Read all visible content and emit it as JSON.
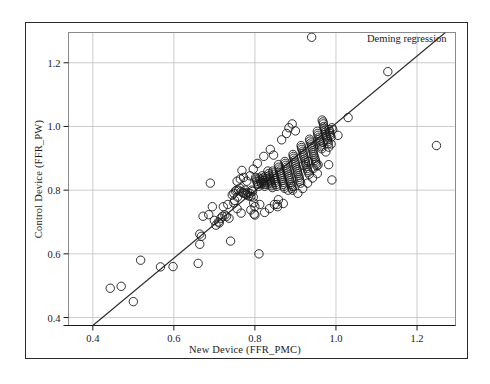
{
  "chart_data": {
    "type": "scatter",
    "title": "",
    "xlabel": "New Device  (FFR_PMC)",
    "ylabel": "Control Device  (FFR_PW)",
    "xlim": [
      0.34,
      1.295
    ],
    "ylim": [
      0.375,
      1.295
    ],
    "xticks": [
      0.4,
      0.6,
      0.8,
      1.0,
      1.2
    ],
    "xticklabels": [
      "0.4",
      "0.6",
      "0.8",
      "1.0",
      "1.2"
    ],
    "yticks": [
      0.4,
      0.6,
      0.8,
      1.0,
      1.2
    ],
    "yticklabels": [
      "0.4",
      "0.6",
      "0.8",
      "1.0",
      "1.2"
    ],
    "grid": true,
    "grid_color": "#bfbfbf",
    "marker": "open-circle",
    "marker_color": "#1a1a1a",
    "marker_size": 4.2,
    "annotations": [
      {
        "text": "Deming regression",
        "x": 1.06,
        "y": 1.265
      }
    ],
    "fit_line": {
      "name": "Deming regression",
      "color": "#2b2b2b",
      "x_start": 0.4,
      "y_start": 0.375,
      "x_end": 1.27,
      "y_end": 1.295
    },
    "series": [
      {
        "name": "FFR measurements",
        "points": [
          [
            0.443,
            0.492
          ],
          [
            0.47,
            0.498
          ],
          [
            0.5,
            0.45
          ],
          [
            0.518,
            0.58
          ],
          [
            0.567,
            0.559
          ],
          [
            0.598,
            0.56
          ],
          [
            0.66,
            0.57
          ],
          [
            0.664,
            0.662
          ],
          [
            0.668,
            0.655
          ],
          [
            0.664,
            0.63
          ],
          [
            0.69,
            0.822
          ],
          [
            0.672,
            0.718
          ],
          [
            0.686,
            0.723
          ],
          [
            0.695,
            0.748
          ],
          [
            0.7,
            0.705
          ],
          [
            0.704,
            0.69
          ],
          [
            0.71,
            0.7
          ],
          [
            0.712,
            0.697
          ],
          [
            0.716,
            0.712
          ],
          [
            0.72,
            0.718
          ],
          [
            0.722,
            0.748
          ],
          [
            0.726,
            0.722
          ],
          [
            0.73,
            0.718
          ],
          [
            0.733,
            0.755
          ],
          [
            0.736,
            0.712
          ],
          [
            0.74,
            0.64
          ],
          [
            0.744,
            0.785
          ],
          [
            0.748,
            0.79
          ],
          [
            0.75,
            0.768
          ],
          [
            0.752,
            0.797
          ],
          [
            0.755,
            0.8
          ],
          [
            0.757,
            0.778
          ],
          [
            0.76,
            0.8
          ],
          [
            0.763,
            0.806
          ],
          [
            0.766,
            0.795
          ],
          [
            0.768,
            0.862
          ],
          [
            0.77,
            0.792
          ],
          [
            0.773,
            0.79
          ],
          [
            0.776,
            0.8
          ],
          [
            0.778,
            0.788
          ],
          [
            0.78,
            0.785
          ],
          [
            0.782,
            0.793
          ],
          [
            0.785,
            0.782
          ],
          [
            0.788,
            0.79
          ],
          [
            0.79,
            0.78
          ],
          [
            0.792,
            0.8
          ],
          [
            0.794,
            0.796
          ],
          [
            0.796,
            0.778
          ],
          [
            0.797,
            0.76
          ],
          [
            0.798,
            0.725
          ],
          [
            0.8,
            0.722
          ],
          [
            0.802,
            0.84
          ],
          [
            0.803,
            0.835
          ],
          [
            0.805,
            0.828
          ],
          [
            0.806,
            0.822
          ],
          [
            0.808,
            0.818
          ],
          [
            0.809,
            0.812
          ],
          [
            0.81,
            0.6
          ],
          [
            0.811,
            0.838
          ],
          [
            0.813,
            0.832
          ],
          [
            0.815,
            0.826
          ],
          [
            0.816,
            0.82
          ],
          [
            0.818,
            0.845
          ],
          [
            0.819,
            0.838
          ],
          [
            0.82,
            0.83
          ],
          [
            0.821,
            0.824
          ],
          [
            0.823,
            0.818
          ],
          [
            0.824,
            0.812
          ],
          [
            0.826,
            0.843
          ],
          [
            0.827,
            0.836
          ],
          [
            0.828,
            0.83
          ],
          [
            0.83,
            0.824
          ],
          [
            0.831,
            0.818
          ],
          [
            0.832,
            0.86
          ],
          [
            0.834,
            0.852
          ],
          [
            0.835,
            0.845
          ],
          [
            0.836,
            0.838
          ],
          [
            0.838,
            0.832
          ],
          [
            0.839,
            0.826
          ],
          [
            0.84,
            0.82
          ],
          [
            0.841,
            0.814
          ],
          [
            0.843,
            0.808
          ],
          [
            0.844,
            0.86
          ],
          [
            0.845,
            0.854
          ],
          [
            0.846,
            0.848
          ],
          [
            0.848,
            0.842
          ],
          [
            0.849,
            0.836
          ],
          [
            0.85,
            0.83
          ],
          [
            0.851,
            0.824
          ],
          [
            0.853,
            0.818
          ],
          [
            0.854,
            0.812
          ],
          [
            0.855,
            0.755
          ],
          [
            0.856,
            0.748
          ],
          [
            0.858,
            0.88
          ],
          [
            0.859,
            0.872
          ],
          [
            0.86,
            0.866
          ],
          [
            0.861,
            0.86
          ],
          [
            0.863,
            0.854
          ],
          [
            0.864,
            0.848
          ],
          [
            0.865,
            0.842
          ],
          [
            0.866,
            0.836
          ],
          [
            0.868,
            0.83
          ],
          [
            0.869,
            0.824
          ],
          [
            0.87,
            0.818
          ],
          [
            0.871,
            0.812
          ],
          [
            0.873,
            0.806
          ],
          [
            0.874,
            0.89
          ],
          [
            0.875,
            0.884
          ],
          [
            0.876,
            0.878
          ],
          [
            0.878,
            0.872
          ],
          [
            0.879,
            0.866
          ],
          [
            0.88,
            0.86
          ],
          [
            0.881,
            0.854
          ],
          [
            0.883,
            0.848
          ],
          [
            0.884,
            0.842
          ],
          [
            0.885,
            0.836
          ],
          [
            0.886,
            0.83
          ],
          [
            0.888,
            0.824
          ],
          [
            0.889,
            0.818
          ],
          [
            0.89,
            0.812
          ],
          [
            0.891,
            0.806
          ],
          [
            0.893,
            0.8
          ],
          [
            0.894,
            0.912
          ],
          [
            0.895,
            0.906
          ],
          [
            0.896,
            0.9
          ],
          [
            0.898,
            0.894
          ],
          [
            0.899,
            0.888
          ],
          [
            0.9,
            0.882
          ],
          [
            0.901,
            0.876
          ],
          [
            0.903,
            0.87
          ],
          [
            0.904,
            0.864
          ],
          [
            0.905,
            0.858
          ],
          [
            0.906,
            0.852
          ],
          [
            0.908,
            0.846
          ],
          [
            0.909,
            0.84
          ],
          [
            0.91,
            0.834
          ],
          [
            0.911,
            0.828
          ],
          [
            0.913,
            0.822
          ],
          [
            0.914,
            0.94
          ],
          [
            0.915,
            0.934
          ],
          [
            0.916,
            0.928
          ],
          [
            0.918,
            0.922
          ],
          [
            0.919,
            0.916
          ],
          [
            0.92,
            0.91
          ],
          [
            0.921,
            0.904
          ],
          [
            0.923,
            0.898
          ],
          [
            0.924,
            0.892
          ],
          [
            0.925,
            0.886
          ],
          [
            0.926,
            0.88
          ],
          [
            0.928,
            0.874
          ],
          [
            0.929,
            0.868
          ],
          [
            0.93,
            0.862
          ],
          [
            0.932,
            0.856
          ],
          [
            0.934,
            0.85
          ],
          [
            0.935,
            0.96
          ],
          [
            0.936,
            0.954
          ],
          [
            0.938,
            0.948
          ],
          [
            0.939,
            0.942
          ],
          [
            0.94,
            0.936
          ],
          [
            0.941,
            0.93
          ],
          [
            0.943,
            0.924
          ],
          [
            0.944,
            0.918
          ],
          [
            0.945,
            0.912
          ],
          [
            0.946,
            0.906
          ],
          [
            0.948,
            0.9
          ],
          [
            0.949,
            0.894
          ],
          [
            0.95,
            0.888
          ],
          [
            0.951,
            0.882
          ],
          [
            0.953,
            0.876
          ],
          [
            0.954,
            0.985
          ],
          [
            0.955,
            0.978
          ],
          [
            0.956,
            0.972
          ],
          [
            0.958,
            0.966
          ],
          [
            0.959,
            0.96
          ],
          [
            0.96,
            0.954
          ],
          [
            0.961,
            0.948
          ],
          [
            0.963,
            0.942
          ],
          [
            0.964,
            0.936
          ],
          [
            0.965,
            0.93
          ],
          [
            0.966,
            1.02
          ],
          [
            0.968,
            1.014
          ],
          [
            0.969,
            1.008
          ],
          [
            0.97,
            1.0
          ],
          [
            0.971,
            0.994
          ],
          [
            0.973,
            0.988
          ],
          [
            0.974,
            0.982
          ],
          [
            0.975,
            0.976
          ],
          [
            0.976,
            0.97
          ],
          [
            0.978,
            0.964
          ],
          [
            0.979,
            0.958
          ],
          [
            0.98,
            0.952
          ],
          [
            0.981,
            0.946
          ],
          [
            0.983,
            0.99
          ],
          [
            0.984,
            0.984
          ],
          [
            0.985,
            0.978
          ],
          [
            0.986,
            0.972
          ],
          [
            0.988,
            0.966
          ],
          [
            0.99,
            0.996
          ],
          [
            0.992,
            0.99
          ],
          [
            0.866,
            0.958
          ],
          [
            0.878,
            0.978
          ],
          [
            0.884,
            0.996
          ],
          [
            0.892,
            1.008
          ],
          [
            0.9,
            0.986
          ],
          [
            0.846,
            0.91
          ],
          [
            0.838,
            0.928
          ],
          [
            0.822,
            0.906
          ],
          [
            0.806,
            0.884
          ],
          [
            0.796,
            0.866
          ],
          [
            0.788,
            0.845
          ],
          [
            0.78,
            0.828
          ],
          [
            0.772,
            0.84
          ],
          [
            0.764,
            0.835
          ],
          [
            0.756,
            0.828
          ],
          [
            0.748,
            0.76
          ],
          [
            0.756,
            0.742
          ],
          [
            0.766,
            0.728
          ],
          [
            0.79,
            0.738
          ],
          [
            0.8,
            0.748
          ],
          [
            0.812,
            0.755
          ],
          [
            0.824,
            0.73
          ],
          [
            0.836,
            0.742
          ],
          [
            0.848,
            0.755
          ],
          [
            0.858,
            0.77
          ],
          [
            0.87,
            0.758
          ],
          [
            0.882,
            0.8
          ],
          [
            0.894,
            0.812
          ],
          [
            0.906,
            0.79
          ],
          [
            0.918,
            0.805
          ],
          [
            0.93,
            0.822
          ],
          [
            0.942,
            0.838
          ],
          [
            0.954,
            0.852
          ],
          [
            0.92,
            0.878
          ],
          [
            0.932,
            0.89
          ],
          [
            0.944,
            0.868
          ],
          [
            0.956,
            0.88
          ],
          [
            0.968,
            0.95
          ],
          [
            0.975,
            0.92
          ],
          [
            0.982,
            0.935
          ],
          [
            0.988,
            0.945
          ],
          [
            0.99,
            0.832
          ],
          [
            0.982,
            0.88
          ],
          [
            1.005,
            0.972
          ],
          [
            1.03,
            1.028
          ],
          [
            0.94,
            1.28
          ],
          [
            1.128,
            1.172
          ],
          [
            1.248,
            0.94
          ]
        ]
      }
    ]
  },
  "axis_title_x": "New Device  (FFR_PMC)",
  "axis_title_y": "Control Device  (FFR_PW)",
  "legend": {
    "label": "Deming regression"
  },
  "ticks": {
    "x": [
      "0.4",
      "0.6",
      "0.8",
      "1.0",
      "1.2"
    ],
    "y": [
      "0.4",
      "0.6",
      "0.8",
      "1.0",
      "1.2"
    ]
  }
}
